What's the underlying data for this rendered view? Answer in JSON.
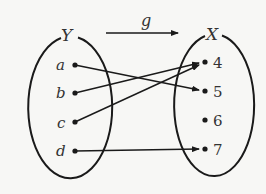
{
  "diagram": {
    "function_label": "g",
    "domain_set": {
      "name": "Y",
      "elements": [
        "a",
        "b",
        "c",
        "d"
      ]
    },
    "codomain_set": {
      "name": "X",
      "elements": [
        "4",
        "5",
        "6",
        "7"
      ]
    },
    "mappings": [
      {
        "from": "a",
        "to": "5"
      },
      {
        "from": "b",
        "to": "4"
      },
      {
        "from": "c",
        "to": "4"
      },
      {
        "from": "d",
        "to": "7"
      }
    ],
    "colors": {
      "stroke": "#1a1a1a",
      "text": "#333333",
      "background": "#f7f7f5"
    }
  }
}
